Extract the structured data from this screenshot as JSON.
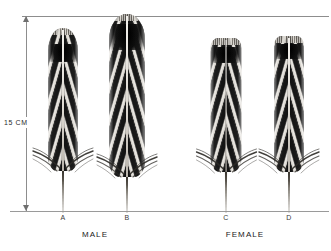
{
  "plate": {
    "scale": {
      "label": "15 CM",
      "axis_name": "vertical-scale-bar"
    },
    "groups": [
      {
        "label": "MALE",
        "center_x": 95
      },
      {
        "label": "FEMALE",
        "center_x": 245
      }
    ],
    "specimens": [
      {
        "id": "A",
        "sex": "MALE",
        "center_x": 63,
        "vane_width": 30,
        "vane_height": 143,
        "vane_top": 32,
        "quill_height": 40,
        "tip_shape": "rounded",
        "dark_band_top_pct": 11,
        "dark_band_height_pct": 13,
        "bar_angle_deg": 74
      },
      {
        "id": "B",
        "sex": "MALE",
        "center_x": 127,
        "vane_width": 36,
        "vane_height": 163,
        "vane_top": 14,
        "quill_height": 34,
        "tip_shape": "rounded",
        "dark_band_top_pct": 6,
        "dark_band_height_pct": 16,
        "bar_angle_deg": 74
      },
      {
        "id": "C",
        "sex": "FEMALE",
        "center_x": 226,
        "vane_width": 31,
        "vane_height": 134,
        "vane_top": 38,
        "quill_height": 39,
        "tip_shape": "flat",
        "dark_band_top_pct": 7,
        "dark_band_height_pct": 12,
        "bar_angle_deg": 74
      },
      {
        "id": "D",
        "sex": "FEMALE",
        "center_x": 289,
        "vane_width": 30,
        "vane_height": 136,
        "vane_top": 36,
        "quill_height": 39,
        "tip_shape": "flat",
        "dark_band_top_pct": 6,
        "dark_band_height_pct": 11,
        "bar_angle_deg": 74
      }
    ],
    "colors": {
      "background": "#ffffff",
      "rule": "#8d8d8d",
      "bar_dark": "#141414",
      "vane_light": "#e8e6e2",
      "quill": "#6a655c",
      "text": "#2a2a2a"
    }
  }
}
